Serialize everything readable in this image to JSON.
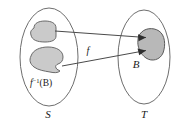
{
  "diagram": {
    "type": "function-preimage-diagram",
    "domain_set": {
      "name": "domain-oval",
      "label": "S",
      "label_x": 48,
      "label_y": 117,
      "cx": 49,
      "cy": 57,
      "rx": 29,
      "ry": 49
    },
    "codomain_set": {
      "name": "codomain-oval",
      "label": "T",
      "label_x": 144,
      "label_y": 117,
      "cx": 144,
      "cy": 57,
      "rx": 26,
      "ry": 47
    },
    "preimage_label": {
      "base": "f",
      "superscript": "−1",
      "argument": "(B)",
      "x": 30,
      "y": 86
    },
    "function_label": {
      "text": "f",
      "x": 88,
      "y": 54
    },
    "image_label": {
      "text": "B",
      "x": 136,
      "y": 68
    },
    "regions": [
      {
        "name": "preimage-upper-blob",
        "fill": "#cacaca",
        "stroke": "#6a6a6a"
      },
      {
        "name": "preimage-lower-blob",
        "fill": "#cacaca",
        "stroke": "#6a6a6a"
      },
      {
        "name": "image-blob-b",
        "fill": "#b8b8b8",
        "stroke": "#5c5c5c"
      }
    ],
    "arrows": [
      {
        "name": "arrow-upper-to-b",
        "from_x": 55,
        "from_y": 31,
        "to_x": 149,
        "to_y": 38
      },
      {
        "name": "arrow-lower-to-b",
        "from_x": 62,
        "from_y": 66,
        "to_x": 149,
        "to_y": 51
      }
    ],
    "colors": {
      "background": "#ffffff",
      "outline": "#6e6e6e",
      "blob_fill": "#cacaca",
      "image_fill": "#b8b8b8",
      "arrow": "#4a4a4a",
      "text": "#1a1a1a"
    }
  }
}
